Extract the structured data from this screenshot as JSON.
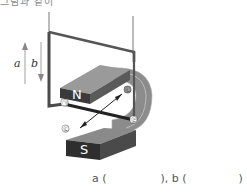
{
  "header": {
    "cut_text": "그림과 같이"
  },
  "diagram": {
    "arrow_a_label": "a",
    "arrow_b_label": "b",
    "arrow_a_direction": "up",
    "arrow_b_direction": "down",
    "magnet": {
      "north_label": "N",
      "south_label": "S"
    },
    "point_labels": [
      "㉠",
      "㉡",
      "㉢",
      "㉣"
    ],
    "colors": {
      "magnet_dark": "#3a3a3a",
      "magnet_gray": "#8c8c8c",
      "wire": "#4a4a4a",
      "label_box": "#ffffff"
    }
  },
  "answer": {
    "a_label": "a (",
    "a_close": "), b (",
    "b_close": ")"
  }
}
